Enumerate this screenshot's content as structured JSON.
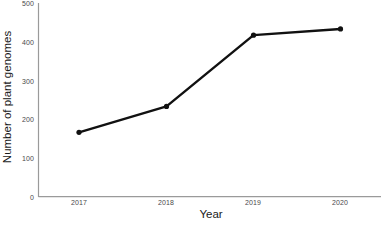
{
  "chart_data": {
    "type": "line",
    "title": "",
    "xlabel": "Year",
    "ylabel": "Number of plant genomes",
    "categories": [
      "2017",
      "2018",
      "2019",
      "2020"
    ],
    "x": [
      2017,
      2018,
      2019,
      2020
    ],
    "values": [
      166,
      233,
      417,
      433
    ],
    "series": [
      {
        "name": "Number of plant genomes",
        "values": [
          166,
          233,
          417,
          433
        ]
      }
    ],
    "ylim": [
      0,
      500
    ],
    "yticks": [
      "0",
      "100",
      "200",
      "300",
      "400",
      "500"
    ],
    "ytick_values": [
      0,
      100,
      200,
      300,
      400,
      500
    ],
    "xticks": [
      "2017",
      "2018",
      "2019",
      "2020"
    ],
    "grid": false,
    "legend": false,
    "legend_position": "none",
    "line_color": "#111111",
    "marker": "circle",
    "marker_color": "#111111",
    "axis_color": "#9a9a9a",
    "background_color": "#ffffff"
  }
}
